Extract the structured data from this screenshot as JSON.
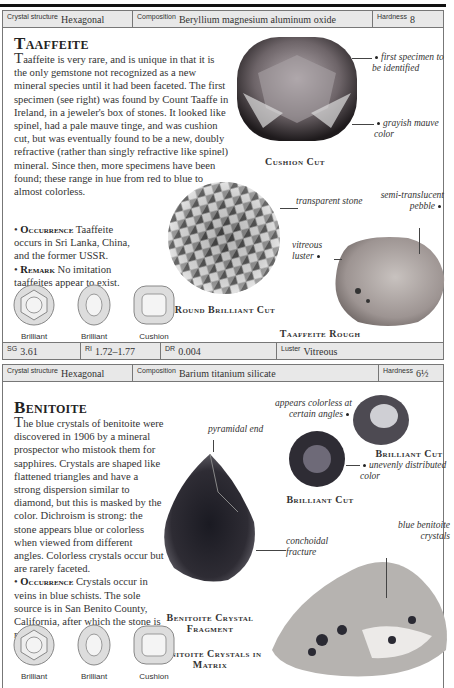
{
  "taaffeite": {
    "header": {
      "crystal_structure_label": "Crystal structure",
      "crystal_structure": "Hexagonal",
      "composition_label": "Composition",
      "composition": "Beryllium magnesium aluminum oxide",
      "hardness_label": "Hardness",
      "hardness": "8"
    },
    "title": "Taaffeite",
    "intro_dropcap": "T",
    "intro": "aaffeite is very rare, and is unique in that it is the only gemstone not recognized as a new mineral species until it had been faceted. The first specimen (see right) was found by Count Taaffe in Ireland, in a jeweler's box of stones. It looked like spinel, had a pale mauve tinge, and was cushion cut, but was eventually found to be a new, doubly refractive (rather than singly refractive like spinel) mineral. Since then, more specimens have been found; these range in hue from red to blue to almost colorless.",
    "occurrence_label": "Occurrence",
    "occurrence": "Taaffeite occurs in Sri Lanka, China, and the former USSR.",
    "remark_label": "Remark",
    "remark": "No imitation taaffeites appear to exist.",
    "cuts": [
      "Brilliant",
      "Brilliant",
      "Cushion"
    ],
    "images": {
      "cushion_caption": "Cushion Cut",
      "cushion_note_1": "first specimen to be identified",
      "cushion_note_2": "grayish mauve color",
      "round_caption": "Round Brilliant Cut",
      "round_note": "transparent stone",
      "rough_caption": "Taaffeite Rough",
      "rough_note_1": "semi-translucent pebble",
      "rough_note_2": "vitreous luster"
    },
    "footer": {
      "sg_label": "SG",
      "sg": "3.61",
      "ri_label": "RI",
      "ri": "1.72–1.77",
      "dr_label": "DR",
      "dr": "0.004",
      "luster_label": "Luster",
      "luster": "Vitreous"
    }
  },
  "benitoite": {
    "header": {
      "crystal_structure_label": "Crystal structure",
      "crystal_structure": "Hexagonal",
      "composition_label": "Composition",
      "composition": "Barium titanium silicate",
      "hardness_label": "Hardness",
      "hardness": "6½"
    },
    "title": "Benitoite",
    "intro_dropcap": "T",
    "intro": "he blue crystals of benitoite were discovered in 1906 by a mineral prospector who mistook them for sapphires. Crystals are shaped like flattened triangles and have a strong dispersion similar to diamond, but this is masked by the color. Dichroism is strong: the stone appears blue or colorless when viewed from different angles. Colorless crystals occur but are rarely faceted.",
    "occurrence_label": "Occurrence",
    "occurrence": "Crystals occur in veins in blue schists. The sole source is in San Benito County, California, after which the stone is named.",
    "cuts": [
      "Brilliant",
      "Brilliant",
      "Cushion"
    ],
    "images": {
      "fragment_note_1": "pyramidal end",
      "fragment_note_2": "conchoidal fracture",
      "fragment_caption": "Benitoite Crystal Fragment",
      "matrix_caption": "Benitoite Crystals in Matrix",
      "matrix_note": "blue benitoite crystals",
      "brilliant1_note": "appears colorless at certain angles",
      "brilliant1_caption": "Brilliant Cut",
      "brilliant2_note": "unevenly distributed color",
      "brilliant2_caption": "Brilliant Cut"
    }
  }
}
